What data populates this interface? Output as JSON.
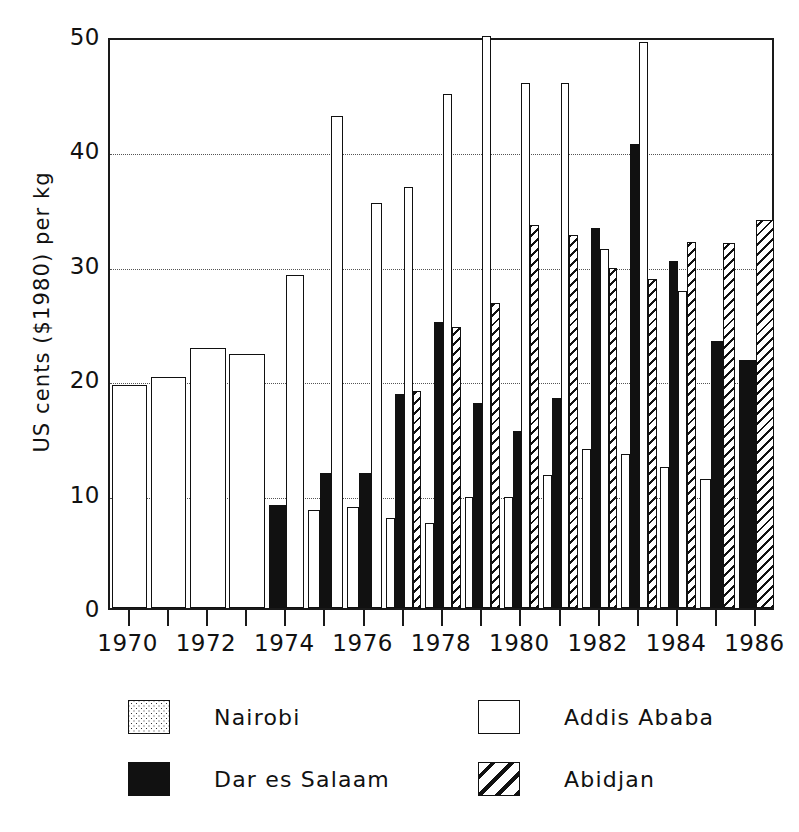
{
  "chart_data": {
    "type": "bar",
    "title": "",
    "xlabel": "",
    "ylabel": "US cents ($1980) per kg",
    "ylim": [
      0,
      50
    ],
    "yticks": [
      0,
      10,
      20,
      30,
      40,
      50
    ],
    "ytick_labels": [
      "0",
      "10",
      "20",
      "30",
      "40",
      "50"
    ],
    "grid": true,
    "grid_axis": "y",
    "legend_position": "below-plot",
    "categories": [
      1970,
      1971,
      1972,
      1973,
      1974,
      1975,
      1976,
      1977,
      1978,
      1979,
      1980,
      1981,
      1982,
      1983,
      1984,
      1985,
      1986
    ],
    "xtick_labels": [
      "1970",
      "1972",
      "1974",
      "1976",
      "1978",
      "1980",
      "1982",
      "1984",
      "1986"
    ],
    "xtick_values": [
      1970,
      1972,
      1974,
      1976,
      1978,
      1980,
      1982,
      1984,
      1986
    ],
    "note": "null means no bar drawn for that series in that year; 1979 Addis Ababa bar is clipped at the top of the axis (>= 50)",
    "series": [
      {
        "name": "Nairobi",
        "pattern": "dotted",
        "values": [
          null,
          null,
          null,
          null,
          null,
          8.6,
          8.8,
          7.9,
          7.4,
          9.7,
          9.7,
          11.6,
          13.9,
          13.5,
          12.3,
          11.3,
          null
        ]
      },
      {
        "name": "Dar es Salaam",
        "pattern": "solid-black",
        "values": [
          null,
          null,
          null,
          null,
          9.0,
          11.8,
          11.8,
          18.7,
          25.0,
          17.9,
          15.5,
          18.4,
          33.2,
          40.6,
          30.3,
          23.3,
          21.7
        ]
      },
      {
        "name": "Addis Ababa",
        "pattern": "open-white",
        "values": [
          19.5,
          20.2,
          22.7,
          22.2,
          29.1,
          43.0,
          35.4,
          36.8,
          44.9,
          50.0,
          45.9,
          45.9,
          31.4,
          49.5,
          27.7,
          null,
          null
        ]
      },
      {
        "name": "Abidjan",
        "pattern": "hatched",
        "values": [
          null,
          null,
          null,
          null,
          null,
          null,
          null,
          19.0,
          24.6,
          26.7,
          33.5,
          32.6,
          29.7,
          28.8,
          32.0,
          31.9,
          33.9
        ]
      }
    ]
  },
  "legend": {
    "entries": [
      {
        "label": "Nairobi",
        "pattern": "dotted"
      },
      {
        "label": "Addis Ababa",
        "pattern": "open-white"
      },
      {
        "label": "Dar es Salaam",
        "pattern": "solid-black"
      },
      {
        "label": "Abidjan",
        "pattern": "hatched"
      }
    ]
  },
  "colors": {
    "ink": "#111111",
    "background": "#ffffff",
    "gridline": "#555555"
  }
}
